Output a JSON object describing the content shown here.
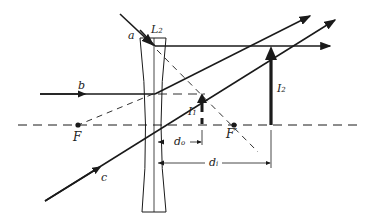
{
  "diagram": {
    "type": "ray-diagram",
    "lens": {
      "label": "L",
      "label_sub": "2"
    },
    "rays": [
      {
        "label": "a"
      },
      {
        "label": "b"
      },
      {
        "label": "c"
      }
    ],
    "focal_points": [
      {
        "label": "F",
        "label_sup": ""
      },
      {
        "label": "F",
        "label_sup": "′"
      }
    ],
    "images": [
      {
        "label": "I",
        "label_sub": "1"
      },
      {
        "label": "I",
        "label_sub": "2"
      }
    ],
    "distances": [
      {
        "label": "d",
        "label_sub": "o"
      },
      {
        "label": "d",
        "label_sub": "i"
      }
    ],
    "colors": {
      "ink": "#1a1a1a",
      "background": "#ffffff"
    }
  }
}
